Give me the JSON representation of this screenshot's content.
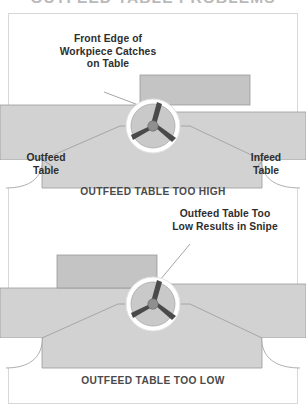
{
  "figure": {
    "title": "OUTFEED TABLE PROBLEMS",
    "colors": {
      "table": "#d2d2d2",
      "table_stroke": "#9a9a9a",
      "workpiece": "#c4c4c4",
      "workpiece_stroke": "#9a9a9a",
      "cutterhead_ring": "#ffffff",
      "cutterhead_body": "#c9c9c9",
      "knife": "#4a4a4a",
      "hub": "#8f8f8f",
      "leader_line": "#9a9a9a",
      "frame": "#d8d8d8",
      "text": "#2e2e2e",
      "caption_text": "#4a4a4a"
    }
  },
  "diagram_top": {
    "callout": {
      "line1": "Front Edge of",
      "line2": "Workpiece Catches",
      "line3": "on Table"
    },
    "left_label": {
      "line1": "Outfeed",
      "line2": "Table"
    },
    "right_label": {
      "line1": "Infeed",
      "line2": "Table"
    },
    "caption": "OUTFEED TABLE TOO HIGH"
  },
  "diagram_bottom": {
    "callout": {
      "line1": "Outfeed Table Too",
      "line2": "Low Results in Snipe"
    },
    "caption": "OUTFEED TABLE TOO LOW"
  }
}
